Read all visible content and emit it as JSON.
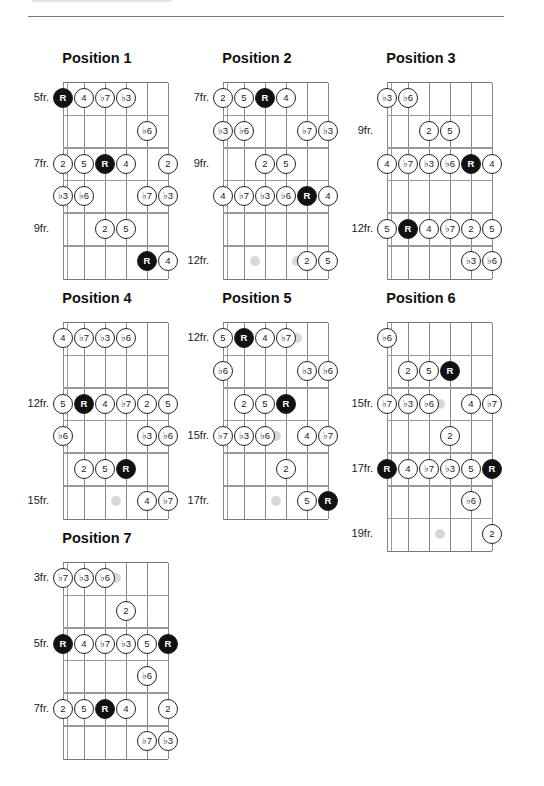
{
  "page": {
    "rule_color": "#777777",
    "root_color": "#111111"
  },
  "diagrams": [
    {
      "title": "Position 1",
      "fret_labels": [
        {
          "row": 0,
          "text": "5fr."
        },
        {
          "row": 2,
          "text": "7fr."
        },
        {
          "row": 4,
          "text": "9fr."
        }
      ],
      "notes": [
        {
          "row": 0,
          "string": 0,
          "label": "R",
          "root": true
        },
        {
          "row": 0,
          "string": 1,
          "label": "4"
        },
        {
          "row": 0,
          "string": 2,
          "label": "♭7"
        },
        {
          "row": 0,
          "string": 3,
          "label": "♭3"
        },
        {
          "row": 1,
          "string": 4,
          "label": "♭6"
        },
        {
          "row": 2,
          "string": 0,
          "label": "2"
        },
        {
          "row": 2,
          "string": 1,
          "label": "5"
        },
        {
          "row": 2,
          "string": 2,
          "label": "R",
          "root": true
        },
        {
          "row": 2,
          "string": 3,
          "label": "4"
        },
        {
          "row": 2,
          "string": 5,
          "label": "2"
        },
        {
          "row": 3,
          "string": 0,
          "label": "♭3"
        },
        {
          "row": 3,
          "string": 1,
          "label": "♭6"
        },
        {
          "row": 3,
          "string": 4,
          "label": "♭7"
        },
        {
          "row": 3,
          "string": 5,
          "label": "♭3"
        },
        {
          "row": 4,
          "string": 2,
          "label": "2"
        },
        {
          "row": 4,
          "string": 3,
          "label": "5"
        },
        {
          "row": 5,
          "string": 4,
          "label": "R",
          "root": true
        },
        {
          "row": 5,
          "string": 5,
          "label": "4"
        }
      ],
      "markers": []
    },
    {
      "title": "Position 2",
      "fret_labels": [
        {
          "row": 0,
          "text": "7fr."
        },
        {
          "row": 2,
          "text": "9fr."
        },
        {
          "row": 5,
          "text": "12fr."
        }
      ],
      "notes": [
        {
          "row": 0,
          "string": 0,
          "label": "2"
        },
        {
          "row": 0,
          "string": 1,
          "label": "5"
        },
        {
          "row": 0,
          "string": 2,
          "label": "R",
          "root": true
        },
        {
          "row": 0,
          "string": 3,
          "label": "4"
        },
        {
          "row": 1,
          "string": 0,
          "label": "♭3"
        },
        {
          "row": 1,
          "string": 1,
          "label": "♭6"
        },
        {
          "row": 1,
          "string": 4,
          "label": "♭7"
        },
        {
          "row": 1,
          "string": 5,
          "label": "♭3"
        },
        {
          "row": 2,
          "string": 2,
          "label": "2"
        },
        {
          "row": 2,
          "string": 3,
          "label": "5"
        },
        {
          "row": 3,
          "string": 0,
          "label": "4"
        },
        {
          "row": 3,
          "string": 1,
          "label": "♭7"
        },
        {
          "row": 3,
          "string": 2,
          "label": "♭3"
        },
        {
          "row": 3,
          "string": 3,
          "label": "♭6"
        },
        {
          "row": 3,
          "string": 4,
          "label": "R",
          "root": true
        },
        {
          "row": 3,
          "string": 5,
          "label": "4"
        },
        {
          "row": 5,
          "string": 4,
          "label": "2"
        },
        {
          "row": 5,
          "string": 5,
          "label": "5"
        }
      ],
      "markers": [
        {
          "row": 5,
          "pos": 1.5
        },
        {
          "row": 5,
          "pos": 3.5
        }
      ]
    },
    {
      "title": "Position 3",
      "fret_labels": [
        {
          "row": 1,
          "text": "9fr."
        },
        {
          "row": 4,
          "text": "12fr."
        }
      ],
      "notes": [
        {
          "row": 0,
          "string": 0,
          "label": "♭3"
        },
        {
          "row": 0,
          "string": 1,
          "label": "♭6"
        },
        {
          "row": 1,
          "string": 2,
          "label": "2"
        },
        {
          "row": 1,
          "string": 3,
          "label": "5"
        },
        {
          "row": 2,
          "string": 0,
          "label": "4"
        },
        {
          "row": 2,
          "string": 1,
          "label": "♭7"
        },
        {
          "row": 2,
          "string": 2,
          "label": "♭3"
        },
        {
          "row": 2,
          "string": 3,
          "label": "♭6"
        },
        {
          "row": 2,
          "string": 4,
          "label": "R",
          "root": true
        },
        {
          "row": 2,
          "string": 5,
          "label": "4"
        },
        {
          "row": 4,
          "string": 0,
          "label": "5"
        },
        {
          "row": 4,
          "string": 1,
          "label": "R",
          "root": true
        },
        {
          "row": 4,
          "string": 2,
          "label": "4"
        },
        {
          "row": 4,
          "string": 3,
          "label": "♭7"
        },
        {
          "row": 4,
          "string": 4,
          "label": "2"
        },
        {
          "row": 4,
          "string": 5,
          "label": "5"
        },
        {
          "row": 5,
          "string": 4,
          "label": "♭3"
        },
        {
          "row": 5,
          "string": 5,
          "label": "♭6"
        }
      ],
      "markers": []
    },
    {
      "title": "Position 4",
      "fret_labels": [
        {
          "row": 2,
          "text": "12fr."
        },
        {
          "row": 5,
          "text": "15fr."
        }
      ],
      "notes": [
        {
          "row": 0,
          "string": 0,
          "label": "4"
        },
        {
          "row": 0,
          "string": 1,
          "label": "♭7"
        },
        {
          "row": 0,
          "string": 2,
          "label": "♭3"
        },
        {
          "row": 0,
          "string": 3,
          "label": "♭6"
        },
        {
          "row": 2,
          "string": 0,
          "label": "5"
        },
        {
          "row": 2,
          "string": 1,
          "label": "R",
          "root": true
        },
        {
          "row": 2,
          "string": 2,
          "label": "4"
        },
        {
          "row": 2,
          "string": 3,
          "label": "♭7"
        },
        {
          "row": 2,
          "string": 4,
          "label": "2"
        },
        {
          "row": 2,
          "string": 5,
          "label": "5"
        },
        {
          "row": 3,
          "string": 0,
          "label": "♭6"
        },
        {
          "row": 3,
          "string": 4,
          "label": "♭3"
        },
        {
          "row": 3,
          "string": 5,
          "label": "♭6"
        },
        {
          "row": 4,
          "string": 1,
          "label": "2"
        },
        {
          "row": 4,
          "string": 2,
          "label": "5"
        },
        {
          "row": 4,
          "string": 3,
          "label": "R",
          "root": true
        },
        {
          "row": 5,
          "string": 4,
          "label": "4"
        },
        {
          "row": 5,
          "string": 5,
          "label": "♭7"
        }
      ],
      "markers": [
        {
          "row": 5,
          "pos": 2.5
        }
      ]
    },
    {
      "title": "Position 5",
      "fret_labels": [
        {
          "row": 0,
          "text": "12fr."
        },
        {
          "row": 3,
          "text": "15fr."
        },
        {
          "row": 5,
          "text": "17fr."
        }
      ],
      "notes": [
        {
          "row": 0,
          "string": 0,
          "label": "5"
        },
        {
          "row": 0,
          "string": 1,
          "label": "R",
          "root": true
        },
        {
          "row": 0,
          "string": 2,
          "label": "4"
        },
        {
          "row": 0,
          "string": 3,
          "label": "♭7"
        },
        {
          "row": 1,
          "string": 0,
          "label": "♭6"
        },
        {
          "row": 1,
          "string": 4,
          "label": "♭3"
        },
        {
          "row": 1,
          "string": 5,
          "label": "♭6"
        },
        {
          "row": 2,
          "string": 1,
          "label": "2"
        },
        {
          "row": 2,
          "string": 2,
          "label": "5"
        },
        {
          "row": 2,
          "string": 3,
          "label": "R",
          "root": true
        },
        {
          "row": 3,
          "string": 0,
          "label": "♭7"
        },
        {
          "row": 3,
          "string": 1,
          "label": "♭3"
        },
        {
          "row": 3,
          "string": 2,
          "label": "♭6"
        },
        {
          "row": 3,
          "string": 4,
          "label": "4"
        },
        {
          "row": 3,
          "string": 5,
          "label": "♭7"
        },
        {
          "row": 4,
          "string": 3,
          "label": "2"
        },
        {
          "row": 5,
          "string": 4,
          "label": "5"
        },
        {
          "row": 5,
          "string": 5,
          "label": "R",
          "root": true
        }
      ],
      "markers": [
        {
          "row": 0,
          "pos": 3.5
        },
        {
          "row": 3,
          "pos": 2.5
        },
        {
          "row": 5,
          "pos": 2.5
        }
      ]
    },
    {
      "title": "Position 6",
      "fret_labels": [
        {
          "row": 2,
          "text": "15fr."
        },
        {
          "row": 4,
          "text": "17fr."
        },
        {
          "row": 6,
          "text": "19fr."
        }
      ],
      "rows": 7,
      "notes": [
        {
          "row": 0,
          "string": 0,
          "label": "♭6"
        },
        {
          "row": 1,
          "string": 1,
          "label": "2"
        },
        {
          "row": 1,
          "string": 2,
          "label": "5"
        },
        {
          "row": 1,
          "string": 3,
          "label": "R",
          "root": true
        },
        {
          "row": 2,
          "string": 0,
          "label": "♭7"
        },
        {
          "row": 2,
          "string": 1,
          "label": "♭3"
        },
        {
          "row": 2,
          "string": 2,
          "label": "♭6"
        },
        {
          "row": 2,
          "string": 4,
          "label": "4"
        },
        {
          "row": 2,
          "string": 5,
          "label": "♭7"
        },
        {
          "row": 3,
          "string": 3,
          "label": "2"
        },
        {
          "row": 4,
          "string": 0,
          "label": "R",
          "root": true
        },
        {
          "row": 4,
          "string": 1,
          "label": "4"
        },
        {
          "row": 4,
          "string": 2,
          "label": "♭7"
        },
        {
          "row": 4,
          "string": 3,
          "label": "♭3"
        },
        {
          "row": 4,
          "string": 4,
          "label": "5"
        },
        {
          "row": 4,
          "string": 5,
          "label": "R",
          "root": true
        },
        {
          "row": 5,
          "string": 4,
          "label": "♭6"
        },
        {
          "row": 6,
          "string": 5,
          "label": "2"
        }
      ],
      "markers": [
        {
          "row": 2,
          "pos": 2.5
        },
        {
          "row": 6,
          "pos": 2.5
        }
      ]
    },
    {
      "title": "Position 7",
      "fret_labels": [
        {
          "row": 0,
          "text": "3fr."
        },
        {
          "row": 2,
          "text": "5fr."
        },
        {
          "row": 4,
          "text": "7fr."
        }
      ],
      "notes": [
        {
          "row": 0,
          "string": 0,
          "label": "♭7"
        },
        {
          "row": 0,
          "string": 1,
          "label": "♭3"
        },
        {
          "row": 0,
          "string": 2,
          "label": "♭6"
        },
        {
          "row": 1,
          "string": 3,
          "label": "2"
        },
        {
          "row": 2,
          "string": 0,
          "label": "R",
          "root": true
        },
        {
          "row": 2,
          "string": 1,
          "label": "4"
        },
        {
          "row": 2,
          "string": 2,
          "label": "♭7"
        },
        {
          "row": 2,
          "string": 3,
          "label": "♭3"
        },
        {
          "row": 2,
          "string": 4,
          "label": "5"
        },
        {
          "row": 2,
          "string": 5,
          "label": "R",
          "root": true
        },
        {
          "row": 3,
          "string": 4,
          "label": "♭6"
        },
        {
          "row": 4,
          "string": 0,
          "label": "2"
        },
        {
          "row": 4,
          "string": 1,
          "label": "5"
        },
        {
          "row": 4,
          "string": 2,
          "label": "R",
          "root": true
        },
        {
          "row": 4,
          "string": 3,
          "label": "4"
        },
        {
          "row": 4,
          "string": 5,
          "label": "2"
        },
        {
          "row": 5,
          "string": 4,
          "label": "♭7"
        },
        {
          "row": 5,
          "string": 5,
          "label": "♭3"
        }
      ],
      "markers": [
        {
          "row": 0,
          "pos": 2.5
        }
      ]
    }
  ]
}
